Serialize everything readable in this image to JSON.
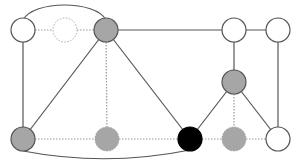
{
  "diagram": {
    "type": "graph",
    "colors": {
      "background": "#ffffff",
      "edge": "#555555",
      "dotted_edge": "#999999",
      "node_stroke": "#555555",
      "white_fill": "#ffffff",
      "gray_fill": "#a6a6a6",
      "black_fill": "#000000",
      "dashed_stroke": "#aaaaaa"
    },
    "node_radius": 12,
    "nodes": [
      {
        "id": "A",
        "x": 23,
        "y": 30,
        "fill": "white",
        "style": "solid"
      },
      {
        "id": "B",
        "x": 65,
        "y": 30,
        "fill": "white",
        "style": "dashed"
      },
      {
        "id": "C",
        "x": 106,
        "y": 30,
        "fill": "gray",
        "style": "solid"
      },
      {
        "id": "D",
        "x": 234,
        "y": 30,
        "fill": "white",
        "style": "solid"
      },
      {
        "id": "E",
        "x": 278,
        "y": 30,
        "fill": "white",
        "style": "solid"
      },
      {
        "id": "F",
        "x": 234,
        "y": 82,
        "fill": "gray",
        "style": "solid"
      },
      {
        "id": "G",
        "x": 23,
        "y": 139,
        "fill": "gray",
        "style": "solid"
      },
      {
        "id": "H",
        "x": 107,
        "y": 139,
        "fill": "gray",
        "style": "dashed"
      },
      {
        "id": "I",
        "x": 190,
        "y": 139,
        "fill": "black",
        "style": "solid"
      },
      {
        "id": "J",
        "x": 234,
        "y": 139,
        "fill": "gray",
        "style": "dashed"
      },
      {
        "id": "K",
        "x": 278,
        "y": 139,
        "fill": "white",
        "style": "solid"
      }
    ],
    "edges": [
      {
        "from": "A",
        "to": "C",
        "style": "solid",
        "curve": "arc-top"
      },
      {
        "from": "A",
        "to": "B",
        "style": "dotted"
      },
      {
        "from": "B",
        "to": "C",
        "style": "dotted"
      },
      {
        "from": "C",
        "to": "D",
        "style": "solid"
      },
      {
        "from": "D",
        "to": "E",
        "style": "solid"
      },
      {
        "from": "D",
        "to": "F",
        "style": "solid"
      },
      {
        "from": "E",
        "to": "K",
        "style": "solid"
      },
      {
        "from": "A",
        "to": "G",
        "style": "solid"
      },
      {
        "from": "C",
        "to": "G",
        "style": "solid"
      },
      {
        "from": "C",
        "to": "H",
        "style": "dotted"
      },
      {
        "from": "C",
        "to": "I",
        "style": "solid"
      },
      {
        "from": "F",
        "to": "I",
        "style": "solid"
      },
      {
        "from": "F",
        "to": "J",
        "style": "dotted"
      },
      {
        "from": "F",
        "to": "K",
        "style": "solid"
      },
      {
        "from": "G",
        "to": "H",
        "style": "dotted"
      },
      {
        "from": "H",
        "to": "I",
        "style": "dotted"
      },
      {
        "from": "I",
        "to": "J",
        "style": "dotted"
      },
      {
        "from": "J",
        "to": "K",
        "style": "dotted"
      },
      {
        "from": "G",
        "to": "I",
        "style": "solid",
        "curve": "arc-bottom"
      }
    ]
  }
}
